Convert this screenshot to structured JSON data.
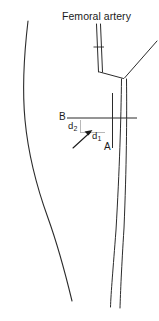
{
  "figure": {
    "title_label": "Femoral artery",
    "background_color": "#ffffff",
    "stroke_color": "#2b2b2b",
    "text_color": "#1b1b1b",
    "width": 159,
    "height": 321,
    "labels": {
      "point_b": "B",
      "point_a": "A",
      "distance_2": "d",
      "distance_2_sub": "2",
      "distance_1": "d",
      "distance_1_sub": "1"
    },
    "annotations": {
      "arrow_direction": "up-right",
      "arrow_target": "intersection of vertical and horizontal reference lines"
    },
    "elements": [
      "femoral-artery-label",
      "artery-trunk",
      "artery-tick-mark",
      "artery-branch-diagonal",
      "artery-distal-left-vessel",
      "artery-distal-right-vessel",
      "limb-outline-curve",
      "reference-line-horizontal",
      "reference-line-vertical",
      "depth-arrow"
    ]
  }
}
